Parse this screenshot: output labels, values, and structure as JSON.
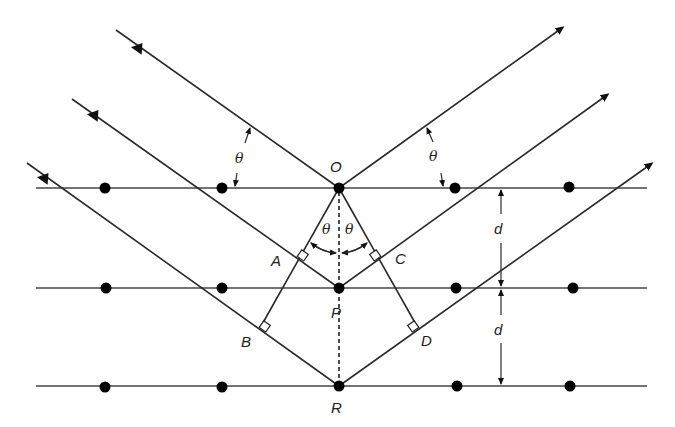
{
  "diagram": {
    "points": {
      "O": "O",
      "P": "P",
      "R": "R",
      "A": "A",
      "B": "B",
      "C": "C",
      "D": "D"
    },
    "angle_symbol": "θ",
    "spacing_symbol": "d",
    "lattice_planes": 3,
    "atoms_per_plane": 5,
    "incident_rays": 3,
    "reflected_rays": 3,
    "angle_labels": [
      "θ",
      "θ",
      "θ",
      "θ"
    ],
    "spacing_labels": [
      "d",
      "d"
    ],
    "colors": {
      "line": "#2a2a2a",
      "atom": "#000000",
      "background": "#ffffff"
    }
  }
}
